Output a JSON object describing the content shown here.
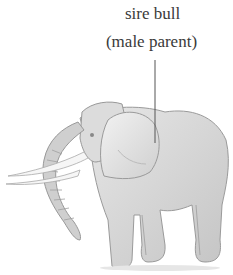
{
  "figure": {
    "label": {
      "line1": "sire bull",
      "line2": "(male parent)"
    },
    "leader_line_color": "#555555",
    "drawing_tone": "#8a8a8a"
  }
}
